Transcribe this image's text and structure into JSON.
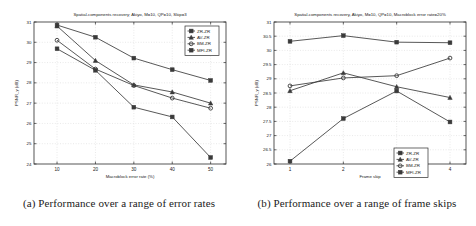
{
  "figure": {
    "panels": [
      {
        "caption": "(a) Performance over a range of error rates",
        "chart_data": {
          "type": "line",
          "title": "Spatial-components recovery; Akiyo, M=10, QP=10, Skip=3",
          "xlabel": "Macroblock error rate (%)",
          "ylabel": "PSNR_y (dB)",
          "x": [
            10,
            20,
            30,
            40,
            50
          ],
          "xticklabels": [
            "10",
            "20",
            "30",
            "40",
            "50"
          ],
          "xlim": [
            4,
            54
          ],
          "ylim": [
            24,
            31
          ],
          "yticks": [
            24,
            25,
            26,
            27,
            28,
            29,
            30,
            31
          ],
          "yticklabels": [
            "24",
            "25",
            "26",
            "27",
            "28",
            "29",
            "30",
            "31"
          ],
          "grid": true,
          "legend_position": "top-right",
          "series": [
            {
              "name": "ZR-ZR",
              "marker": "square",
              "values": [
                30.85,
                30.25,
                29.22,
                28.65,
                28.12
              ]
            },
            {
              "name": "AV-ZR",
              "marker": "triangle",
              "values": [
                30.8,
                29.1,
                27.9,
                27.55,
                27.0
              ]
            },
            {
              "name": "BM-ZR",
              "marker": "circle",
              "values": [
                30.1,
                28.68,
                27.87,
                27.25,
                26.75
              ]
            },
            {
              "name": "MFI-ZR",
              "marker": "square",
              "values": [
                29.68,
                28.62,
                26.8,
                26.32,
                24.32
              ]
            }
          ]
        }
      },
      {
        "caption": "(b) Performance over a range of frame skips",
        "chart_data": {
          "type": "line",
          "title": "Spatial-components recovery, Akiyo, M=10, QP=10, Macroblock error rate=20%",
          "xlabel": "Frame skip",
          "ylabel": "PSNR_y (dB)",
          "x": [
            1,
            2,
            3,
            4
          ],
          "xticklabels": [
            "1",
            "2",
            "3",
            "4"
          ],
          "xlim": [
            0.7,
            4.3
          ],
          "ylim": [
            26,
            31
          ],
          "yticks": [
            26,
            26.5,
            27,
            27.5,
            28,
            28.5,
            29,
            29.5,
            30,
            30.5,
            31
          ],
          "yticklabels": [
            "26",
            "26.5",
            "27",
            "27.5",
            "28",
            "28.5",
            "29",
            "29.5",
            "30",
            "30.5",
            "31"
          ],
          "grid": true,
          "legend_position": "bottom-right",
          "series": [
            {
              "name": "ZR-ZR",
              "marker": "square",
              "values": [
                30.32,
                30.52,
                30.29,
                30.27
              ]
            },
            {
              "name": "AV-ZR",
              "marker": "triangle",
              "values": [
                28.58,
                29.21,
                28.72,
                28.34
              ]
            },
            {
              "name": "BM-ZR",
              "marker": "circle",
              "values": [
                28.75,
                29.03,
                29.11,
                29.73
              ]
            },
            {
              "name": "MFI-ZR",
              "marker": "square",
              "values": [
                26.1,
                27.6,
                28.57,
                27.48
              ]
            }
          ]
        }
      }
    ]
  }
}
